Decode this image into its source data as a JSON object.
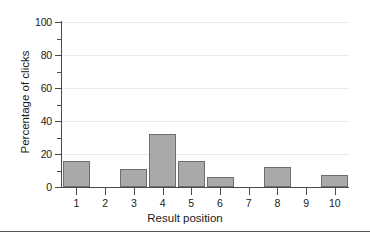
{
  "chart_data": {
    "type": "bar",
    "title": "",
    "subtitle": "",
    "xlabel": "Result position",
    "ylabel": "Percentage of clicks",
    "categories": [
      "1",
      "2",
      "3",
      "4",
      "5",
      "6",
      "7",
      "8",
      "9",
      "10"
    ],
    "values": [
      16,
      0,
      11,
      32,
      16,
      6,
      0,
      12,
      0,
      7
    ],
    "series": [
      {
        "name": "Percentage of clicks",
        "values": [
          16,
          0,
          11,
          32,
          16,
          6,
          0,
          12,
          0,
          7
        ]
      }
    ],
    "ylim": [
      0,
      100
    ],
    "xlim": [
      0.5,
      10.5
    ],
    "y_major_ticks": [
      0,
      20,
      40,
      60,
      80,
      100
    ],
    "y_minor_ticks": [
      10,
      30,
      50,
      70,
      90
    ],
    "y_tick_labels": [
      "0",
      "20",
      "40",
      "60",
      "80",
      "100"
    ],
    "grid": true,
    "grid_style": "dotted",
    "grid_axis": "y",
    "legend": false,
    "legend_position": "none",
    "annotations": [],
    "colors": {
      "bar_fill": "#a9a9a9",
      "bar_stroke": "#6e6e6e",
      "axis": "#4a4a4a",
      "grid": "#d9d9d9",
      "text": "#1a1a1a",
      "background": "#ffffff",
      "rule": "#555555"
    }
  }
}
